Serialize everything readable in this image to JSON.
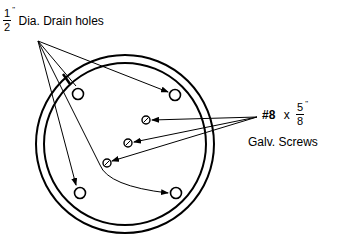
{
  "drain_holes": {
    "fraction_numerator": "1",
    "fraction_denominator": "2",
    "inch_mark": "\"",
    "label": "Dia. Drain holes"
  },
  "screws": {
    "size": "#8",
    "times": "x",
    "fraction_numerator": "5",
    "fraction_denominator": "8",
    "inch_mark": "\"",
    "label": "Galv. Screws"
  },
  "diagram": {
    "outer_ring": {
      "cx": 125,
      "cy": 144,
      "r": 89
    },
    "inner_ring": {
      "cx": 125,
      "cy": 144,
      "r": 81
    },
    "drain_holes": [
      {
        "cx": 78,
        "cy": 94
      },
      {
        "cx": 175,
        "cy": 95
      },
      {
        "cx": 80,
        "cy": 193
      },
      {
        "cx": 176,
        "cy": 193
      }
    ],
    "screw_holes": [
      {
        "cx": 146,
        "cy": 120
      },
      {
        "cx": 128,
        "cy": 143
      },
      {
        "cx": 107,
        "cy": 163
      }
    ],
    "drain_arrow_origin": {
      "x": 38,
      "y": 41
    },
    "screw_arrow_origin": {
      "x": 257,
      "y": 117
    }
  }
}
